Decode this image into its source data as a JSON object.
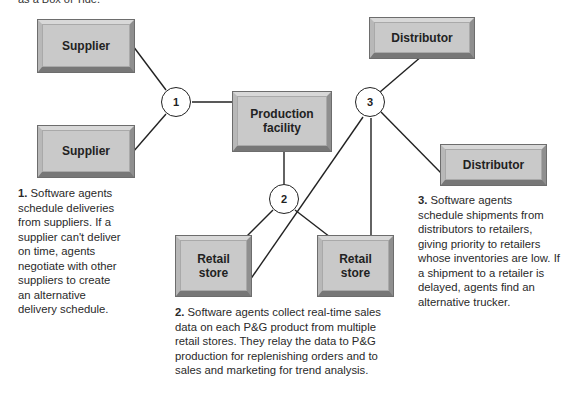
{
  "caption_fragment": "as a Box of Tide.",
  "nodes": {
    "supplier_top": {
      "label": "Supplier"
    },
    "supplier_bottom": {
      "label": "Supplier"
    },
    "production": {
      "label": "Production facility"
    },
    "distributor_top": {
      "label": "Distributor"
    },
    "distributor_right": {
      "label": "Distributor"
    },
    "retail_left": {
      "label": "Retail store"
    },
    "retail_right": {
      "label": "Retail store"
    }
  },
  "agents": [
    {
      "number": "1"
    },
    {
      "number": "2"
    },
    {
      "number": "3"
    }
  ],
  "notes": [
    {
      "number": "1.",
      "text": "Software agents schedule deliveries from suppliers. If a supplier can't deliver on time, agents negotiate with other suppliers to create an alternative delivery schedule."
    },
    {
      "number": "2.",
      "text": "Software agents collect real-time sales data on each P&G product from multiple retail stores. They relay the data to P&G production for replenishing orders and to sales and marketing for trend analysis."
    },
    {
      "number": "3.",
      "text": "Software agents schedule shipments from distributors to retailers, giving priority to retailers whose inventories are low. If a shipment to a retailer is delayed, agents find an alternative trucker."
    }
  ]
}
